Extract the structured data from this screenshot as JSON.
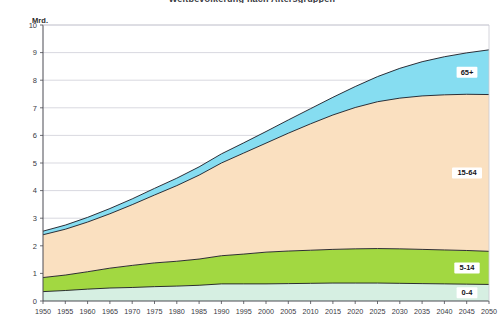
{
  "title": {
    "text": "Weltbevölkerung nach Altersgruppen"
  },
  "unit": {
    "label": "Mrd."
  },
  "axes": {
    "y_ticks": [
      "0",
      "1",
      "2",
      "3",
      "4",
      "5",
      "6",
      "7",
      "8",
      "9",
      "10"
    ],
    "x_ticks": [
      "1950",
      "1955",
      "1960",
      "1965",
      "1970",
      "1975",
      "1980",
      "1985",
      "1990",
      "1995",
      "2000",
      "2005",
      "2010",
      "2015",
      "2020",
      "2025",
      "2030",
      "2035",
      "2040",
      "2045",
      "2050"
    ]
  },
  "band_labels": [
    {
      "name": "65+",
      "text": "65+"
    },
    {
      "name": "15-64",
      "text": "15-64"
    },
    {
      "name": "5-14",
      "text": "5-14"
    },
    {
      "name": "0-4",
      "text": "0-4"
    }
  ],
  "colors": {
    "band_0_4": "#D6EFE2",
    "band_5_14": "#A2D841",
    "band_15_64": "#FAE0C0",
    "band_65plus": "#86DDF1",
    "outline": "#1a1a22",
    "grid": "#c9c9d2",
    "axis": "#4a4a52",
    "background": "#ffffff",
    "text": "#39393f"
  },
  "chart_data": {
    "type": "area",
    "title": "Weltbevölkerung nach Altersgruppen",
    "xlabel": "",
    "ylabel": "Mrd.",
    "ylim": [
      0,
      10
    ],
    "xlim": [
      1950,
      2050
    ],
    "grid": true,
    "stacked": true,
    "legend": "inline-right",
    "x": [
      1950,
      1955,
      1960,
      1965,
      1970,
      1975,
      1980,
      1985,
      1990,
      1995,
      2000,
      2005,
      2010,
      2015,
      2020,
      2025,
      2030,
      2035,
      2040,
      2045,
      2050
    ],
    "series": [
      {
        "name": "0-4",
        "values": [
          0.34,
          0.38,
          0.43,
          0.47,
          0.49,
          0.52,
          0.54,
          0.57,
          0.62,
          0.62,
          0.62,
          0.63,
          0.64,
          0.65,
          0.65,
          0.65,
          0.64,
          0.63,
          0.62,
          0.61,
          0.6
        ]
      },
      {
        "name": "5-14",
        "values": [
          0.51,
          0.56,
          0.63,
          0.72,
          0.8,
          0.86,
          0.9,
          0.95,
          1.02,
          1.08,
          1.15,
          1.18,
          1.2,
          1.22,
          1.24,
          1.25,
          1.25,
          1.24,
          1.23,
          1.22,
          1.2
        ]
      },
      {
        "name": "15-64",
        "values": [
          1.55,
          1.66,
          1.8,
          1.97,
          2.2,
          2.46,
          2.74,
          3.04,
          3.36,
          3.66,
          3.95,
          4.27,
          4.58,
          4.87,
          5.12,
          5.32,
          5.46,
          5.56,
          5.62,
          5.66,
          5.68
        ]
      },
      {
        "name": "65+",
        "values": [
          0.13,
          0.15,
          0.17,
          0.19,
          0.21,
          0.24,
          0.27,
          0.3,
          0.33,
          0.37,
          0.42,
          0.48,
          0.55,
          0.64,
          0.76,
          0.91,
          1.08,
          1.24,
          1.38,
          1.5,
          1.62
        ]
      }
    ],
    "totals": [
      2.53,
      2.75,
      3.03,
      3.35,
      3.7,
      4.08,
      4.45,
      4.86,
      5.33,
      5.73,
      6.14,
      6.56,
      6.97,
      7.38,
      7.77,
      8.13,
      8.43,
      8.67,
      8.85,
      8.99,
      9.1
    ]
  }
}
